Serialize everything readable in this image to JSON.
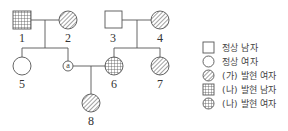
{
  "diagram": {
    "type": "pedigree",
    "individuals": [
      {
        "id": "1",
        "label": "1",
        "sex": "male",
        "phenotype": "(나) 발현 남자"
      },
      {
        "id": "2",
        "label": "2",
        "sex": "female",
        "phenotype": "(가) 발현 여자"
      },
      {
        "id": "3",
        "label": "3",
        "sex": "male",
        "phenotype": "정상 남자"
      },
      {
        "id": "4",
        "label": "4",
        "sex": "female",
        "phenotype": "(가) 발현 여자"
      },
      {
        "id": "5",
        "label": "5",
        "sex": "female",
        "phenotype": "정상 여자"
      },
      {
        "id": "a",
        "label": "a",
        "sex": "unknown",
        "phenotype": "unspecified"
      },
      {
        "id": "6",
        "label": "6",
        "sex": "female",
        "phenotype": "(나) 발현 여자"
      },
      {
        "id": "7",
        "label": "7",
        "sex": "female",
        "phenotype": "(가) 발현 여자"
      },
      {
        "id": "8",
        "label": "8",
        "sex": "female",
        "phenotype": "(가) 발현 여자"
      }
    ],
    "couples": [
      [
        "1",
        "2"
      ],
      [
        "3",
        "4"
      ],
      [
        "a",
        "6"
      ]
    ],
    "children": {
      "1-2": [
        "5",
        "a"
      ],
      "3-4": [
        "6",
        "7"
      ],
      "a-6": [
        "8"
      ]
    }
  },
  "labels": {
    "n1": "1",
    "n2": "2",
    "n3": "3",
    "n4": "4",
    "n5": "5",
    "n6": "6",
    "n7": "7",
    "n8": "8",
    "na": "a"
  },
  "legend": [
    {
      "icon": "square-empty",
      "label": "정상 남자"
    },
    {
      "icon": "circle-empty",
      "label": "정상 여자"
    },
    {
      "icon": "circle-hatched",
      "label": "(가) 발현 여자"
    },
    {
      "icon": "square-grid",
      "label": "(나) 발현 남자"
    },
    {
      "icon": "circle-grid",
      "label": "(나) 발현 여자"
    }
  ],
  "colors": {
    "line": "#555555",
    "fill_bg": "#ffffff"
  }
}
